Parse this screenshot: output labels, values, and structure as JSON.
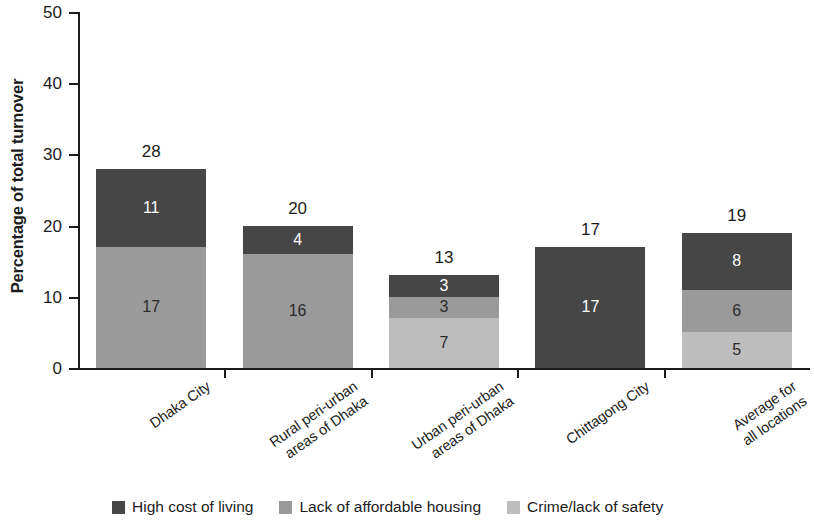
{
  "chart_data": {
    "type": "bar",
    "subtype": "stacked-bar",
    "title": "",
    "xlabel": "",
    "ylabel": "Percentage of total turnover",
    "ylim": [
      0,
      50
    ],
    "yticks": [
      0,
      10,
      20,
      30,
      40,
      50
    ],
    "grid": false,
    "legend_position": "bottom",
    "categories": [
      "Dhaka City",
      "Rural peri-urban\nareas of Dhaka",
      "Urban peri-urban\nareas of Dhaka",
      "Chittagong City",
      "Average for\nall locations"
    ],
    "series": [
      {
        "name": "High cost of living",
        "color": "#464646",
        "values": [
          11,
          4,
          3,
          17,
          8
        ],
        "label_color": "#ffffff"
      },
      {
        "name": "Lack of affordable housing",
        "color": "#9a9a9a",
        "values": [
          17,
          16,
          3,
          0,
          6
        ],
        "label_color": "#2b2b2b"
      },
      {
        "name": "Crime/lack of safety",
        "color": "#bdbdbd",
        "values": [
          0,
          0,
          7,
          0,
          5
        ],
        "label_color": "#2b2b2b"
      }
    ],
    "totals": [
      28,
      20,
      13,
      17,
      19
    ],
    "total_label_color": "#1c1c1c"
  },
  "axis": {
    "y_tick_labels": [
      "0",
      "10",
      "20",
      "30",
      "40",
      "50"
    ]
  },
  "legend": {
    "items": [
      {
        "label": "High cost of living",
        "color": "#464646"
      },
      {
        "label": "Lack of affordable housing",
        "color": "#9a9a9a"
      },
      {
        "label": "Crime/lack of safety",
        "color": "#bdbdbd"
      }
    ]
  }
}
